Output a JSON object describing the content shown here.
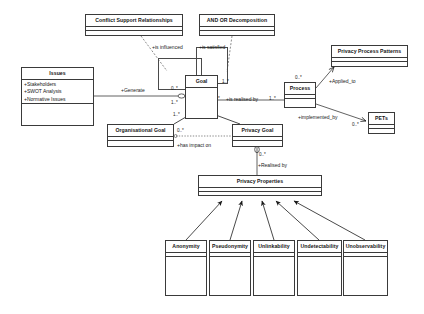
{
  "diagram": {
    "classes": [
      {
        "id": "conflict-support-relationships",
        "name": "Conflict Support Relationships",
        "attributes": [],
        "x": 85,
        "y": 14,
        "w": 98,
        "h": 22
      },
      {
        "id": "and-or-decomposition",
        "name": "AND OR Decomposition",
        "attributes": [],
        "x": 199,
        "y": 14,
        "w": 76,
        "h": 22
      },
      {
        "id": "privacy-process-patterns",
        "name": "Privacy Process Patterns",
        "attributes": [],
        "x": 331,
        "y": 45,
        "w": 77,
        "h": 22
      },
      {
        "id": "issues",
        "name": "Issues",
        "attributes": [
          "+Stakeholders",
          "+SWOT Analysis",
          "+Normative Issues",
          "+Legal Issues"
        ],
        "x": 21,
        "y": 67,
        "w": 73,
        "h": 59
      },
      {
        "id": "goal",
        "name": "Goal",
        "attributes": [],
        "x": 185,
        "y": 75,
        "w": 33,
        "h": 44
      },
      {
        "id": "process",
        "name": "Process",
        "attributes": [],
        "x": 284,
        "y": 82,
        "w": 32,
        "h": 26
      },
      {
        "id": "pets",
        "name": "PETs",
        "attributes": [],
        "x": 368,
        "y": 112,
        "w": 27,
        "h": 22
      },
      {
        "id": "organisational-goal",
        "name": "Organisational Goal",
        "attributes": [],
        "x": 107,
        "y": 124,
        "w": 67,
        "h": 23
      },
      {
        "id": "privacy-goal",
        "name": "Privacy Goal",
        "attributes": [],
        "x": 232,
        "y": 124,
        "w": 51,
        "h": 23
      },
      {
        "id": "privacy-properties",
        "name": "Privacy Properties",
        "attributes": [],
        "x": 198,
        "y": 175,
        "w": 124,
        "h": 21
      },
      {
        "id": "anonymity",
        "name": "Anonymity",
        "attributes": [],
        "x": 165,
        "y": 240,
        "w": 42,
        "h": 56
      },
      {
        "id": "pseudonymity",
        "name": "Pseudonymity",
        "attributes": [],
        "x": 209,
        "y": 240,
        "w": 42,
        "h": 56
      },
      {
        "id": "unlinkability",
        "name": "Unlinkability",
        "attributes": [],
        "x": 253,
        "y": 240,
        "w": 42,
        "h": 56
      },
      {
        "id": "undetectability",
        "name": "Undetectability",
        "attributes": [],
        "x": 297,
        "y": 240,
        "w": 45,
        "h": 56
      },
      {
        "id": "unobservability",
        "name": "Unobservability",
        "attributes": [],
        "x": 343,
        "y": 240,
        "w": 45,
        "h": 56
      }
    ],
    "relationship_labels": [
      {
        "id": "is-influenced",
        "text": "+is influenced",
        "x": 152,
        "y": 44
      },
      {
        "id": "is-satisfied",
        "text": "+is satisfied",
        "x": 199,
        "y": 44
      },
      {
        "id": "applied-to",
        "text": "+Applied_to",
        "x": 329,
        "y": 78
      },
      {
        "id": "generate",
        "text": "+Generate",
        "x": 121,
        "y": 87
      },
      {
        "id": "is-realised-by",
        "text": "+is realised by",
        "x": 226,
        "y": 101
      },
      {
        "id": "implemented-by",
        "text": "+implemented_by",
        "x": 298,
        "y": 114
      },
      {
        "id": "has-impact-on",
        "text": "+has impact on",
        "x": 177,
        "y": 142
      },
      {
        "id": "realised-by",
        "text": "+Realised by",
        "x": 258,
        "y": 162
      }
    ],
    "multiplicities": [
      {
        "id": "mult-goal-left-top",
        "text": "0..*",
        "x": 171,
        "y": 86
      },
      {
        "id": "mult-goal-left-bottom",
        "text": "1..*",
        "x": 171,
        "y": 99
      },
      {
        "id": "mult-goal-right-top",
        "text": "1..*",
        "x": 222,
        "y": 77
      },
      {
        "id": "mult-goal-org",
        "text": "1..*",
        "x": 175,
        "y": 110
      },
      {
        "id": "mult-goal-priv",
        "text": "0..*",
        "x": 209,
        "y": 110
      },
      {
        "id": "mult-realised-left",
        "text": "1..*",
        "x": 214,
        "y": 101
      },
      {
        "id": "mult-realised-right",
        "text": "1..*",
        "x": 268,
        "y": 101
      },
      {
        "id": "mult-org-right",
        "text": "0..*",
        "x": 176,
        "y": 127
      },
      {
        "id": "mult-process-top",
        "text": "0..*",
        "x": 292,
        "y": 76
      },
      {
        "id": "mult-pets-left",
        "text": "0..*",
        "x": 352,
        "y": 121
      },
      {
        "id": "mult-privacy-goal-bottom",
        "text": "0..*",
        "x": 258,
        "y": 152
      }
    ]
  },
  "style": {
    "line_color": "#3a3a3a",
    "text_color": "#151515",
    "background": "#ffffff"
  }
}
